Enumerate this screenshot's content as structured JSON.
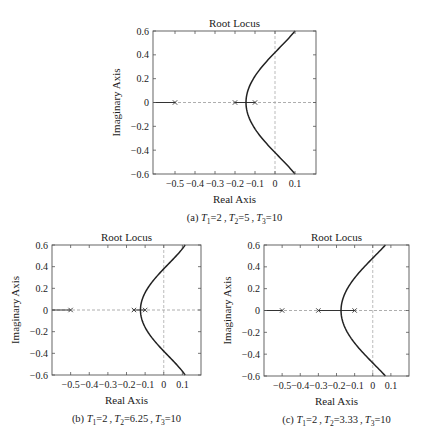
{
  "chart_data": [
    {
      "id": "a",
      "type": "line",
      "title": "Root Locus",
      "xlabel": "Real Axis",
      "ylabel": "Imaginary Axis",
      "xlim": [
        -0.61,
        0.205
      ],
      "ylim": [
        -0.6,
        0.6
      ],
      "xticks": [
        -0.5,
        -0.4,
        -0.3,
        -0.2,
        -0.1,
        0,
        0.1
      ],
      "xtick_labels": [
        "−0.5",
        "−0.4",
        "−0.3",
        "−0.2",
        "−0.1",
        "0",
        "0.1"
      ],
      "yticks": [
        0.6,
        0.4,
        0.2,
        0,
        -0.2,
        -0.4,
        -0.6
      ],
      "ytick_labels": [
        "0.6",
        "0.4",
        "0.2",
        "0",
        "−0.2",
        "−0.4",
        "−0.6"
      ],
      "grid": false,
      "poles": [
        -0.5,
        -0.2,
        -0.1
      ],
      "real_axis_solid_segments": [
        [
          -0.61,
          -0.5
        ],
        [
          -0.2,
          -0.1
        ]
      ],
      "breakaway": -0.145,
      "imag_crossing": 0.42,
      "branch_end": [
        0.1,
        0.6
      ],
      "caption": {
        "prefix": "(a) ",
        "T1": "2",
        "T2": "5",
        "T3": "10"
      }
    },
    {
      "id": "b",
      "type": "line",
      "title": "Root Locus",
      "xlabel": "Real Axis",
      "ylabel": "Imaginary Axis",
      "xlim": [
        -0.6,
        0.2
      ],
      "ylim": [
        -0.6,
        0.6
      ],
      "xticks": [
        -0.5,
        -0.4,
        -0.3,
        -0.2,
        -0.1,
        0,
        0.1
      ],
      "xtick_labels": [
        "−0.5",
        "−0.4",
        "−0.3",
        "−0.2",
        "−0.1",
        "0",
        "0.1"
      ],
      "yticks": [
        0.6,
        0.4,
        0.2,
        0,
        -0.2,
        -0.4,
        -0.6
      ],
      "ytick_labels": [
        "0.6",
        "0.4",
        "0.2",
        "0",
        "−0.2",
        "−0.4",
        "−0.6"
      ],
      "grid": false,
      "poles": [
        -0.5,
        -0.16,
        -0.1
      ],
      "real_axis_solid_segments": [
        [
          -0.6,
          -0.5
        ],
        [
          -0.16,
          -0.1
        ]
      ],
      "breakaway": -0.125,
      "imag_crossing": 0.38,
      "branch_end": [
        0.115,
        0.6
      ],
      "caption": {
        "prefix": "(b) ",
        "T1": "2",
        "T2": "6.25",
        "T3": "10"
      }
    },
    {
      "id": "c",
      "type": "line",
      "title": "Root Locus",
      "xlabel": "Real Axis",
      "ylabel": "Imaginary Axis",
      "xlim": [
        -0.6,
        0.2
      ],
      "ylim": [
        -0.6,
        0.6
      ],
      "xticks": [
        -0.5,
        -0.4,
        -0.3,
        -0.2,
        -0.1,
        0,
        0.1
      ],
      "xtick_labels": [
        "−0.5",
        "−0.4",
        "−0.3",
        "−0.2",
        "−0.1",
        "0",
        "0.1"
      ],
      "yticks": [
        0.6,
        0.4,
        0.2,
        0,
        -0.2,
        -0.4,
        -0.6
      ],
      "ytick_labels": [
        "0.6",
        "0.4",
        "0.2",
        "0",
        "−0.2",
        "−0.4",
        "−0.6"
      ],
      "grid": false,
      "poles": [
        -0.5,
        -0.3,
        -0.1
      ],
      "real_axis_solid_segments": [
        [
          -0.6,
          -0.5
        ],
        [
          -0.3,
          -0.1
        ]
      ],
      "breakaway": -0.175,
      "imag_crossing": 0.48,
      "branch_end": [
        0.07,
        0.6
      ],
      "caption": {
        "prefix": "(c) ",
        "T1": "2",
        "T2": "3.33",
        "T3": "10"
      }
    }
  ],
  "layout": {
    "panels": [
      {
        "box": [
          153,
          31,
          163,
          143
        ]
      },
      {
        "box": [
          52,
          245,
          149,
          130
        ]
      },
      {
        "box": [
          264,
          245,
          145,
          131
        ]
      }
    ]
  }
}
